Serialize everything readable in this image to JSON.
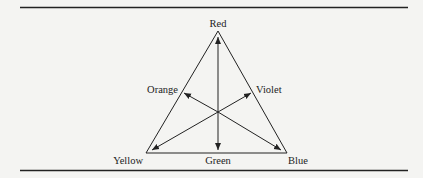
{
  "diagram": {
    "type": "color-triangle",
    "vertices": {
      "top": "Red",
      "bottom_left": "Yellow",
      "bottom_right": "Blue"
    },
    "edge_midpoints": {
      "left": "Orange",
      "right": "Violet",
      "bottom": "Green"
    },
    "arrows": [
      {
        "from": "Green",
        "to": "Red"
      },
      {
        "from": "Red",
        "to": "Green"
      },
      {
        "from": "Violet",
        "to": "Yellow"
      },
      {
        "from": "Yellow",
        "to": "Violet"
      },
      {
        "from": "Orange",
        "to": "Blue"
      },
      {
        "from": "Blue",
        "to": "Orange"
      }
    ],
    "colors": {
      "ink": "#222222",
      "background": "#f4f4f2"
    }
  }
}
